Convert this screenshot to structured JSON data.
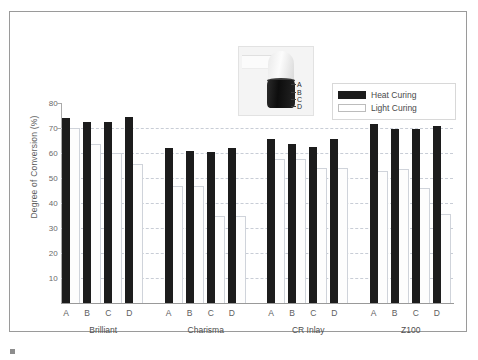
{
  "chart_data": {
    "type": "bar",
    "title": "",
    "xlabel": "",
    "ylabel": "Degree of Conversion (%)",
    "ylim": [
      0,
      80
    ],
    "yticks": [
      10,
      20,
      30,
      40,
      50,
      60,
      70,
      80
    ],
    "grid": true,
    "legend_position": "top-right",
    "groups": [
      "Brilliant",
      "Charisma",
      "CR Inlay",
      "Z100"
    ],
    "categories": [
      "A",
      "B",
      "C",
      "D"
    ],
    "series": [
      {
        "name": "Heat Curing",
        "color": "#1c1c1c",
        "values": [
          [
            74.0,
            72.5,
            72.5,
            74.5
          ],
          [
            62.0,
            61.0,
            60.5,
            62.0
          ],
          [
            65.5,
            63.5,
            62.5,
            65.5
          ],
          [
            71.5,
            69.5,
            69.5,
            71.0
          ]
        ]
      },
      {
        "name": "Light Curing",
        "color": "#ffffff",
        "values": [
          [
            70.0,
            63.5,
            60.0,
            55.5
          ],
          [
            47.0,
            47.0,
            35.0,
            35.0
          ],
          [
            57.5,
            57.5,
            54.0,
            54.0
          ],
          [
            53.0,
            53.5,
            46.0,
            35.5
          ]
        ]
      }
    ]
  },
  "legend": {
    "items": [
      {
        "label": "Heat Curing",
        "swatch": "filled-black"
      },
      {
        "label": "Light Curing",
        "swatch": "outlined-white"
      }
    ]
  },
  "inset": {
    "alt": "curing light tip over composite resin specimen",
    "depth_labels": [
      "A",
      "B",
      "C",
      "D"
    ]
  },
  "caption": {
    "marker": "",
    "text": ""
  }
}
